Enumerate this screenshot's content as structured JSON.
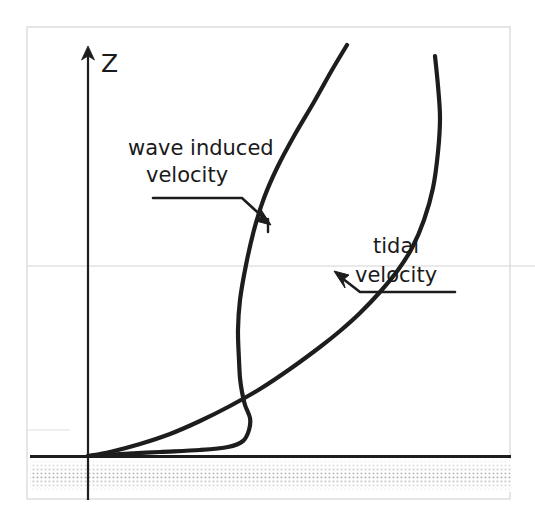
{
  "figure": {
    "type": "velocity-profile-diagram",
    "background_color": "#ffffff",
    "ink_color": "#1d1d1d",
    "frame_color": "#d8d8d8",
    "gridline_color": "#d0d0d0",
    "seabed_color": "#4a4a4a"
  },
  "axis": {
    "vertical_label": "Z",
    "arrow_direction": "up",
    "x_px": 88,
    "top_px": 48,
    "bottom_px": 500
  },
  "annotations": [
    {
      "id": "wave-induced-velocity",
      "line1": "wave induced",
      "line2": "velocity",
      "full_text": "wave induced velocity",
      "leader_style": "underline-then-elbow-arrow",
      "arrow_points_to": "wave induced velocity curve"
    },
    {
      "id": "tidal-velocity",
      "line1": "tidal",
      "line2": "velocity",
      "full_text": "tidal velocity",
      "leader_style": "underline-then-elbow-arrow",
      "arrow_points_to": "tidal velocity curve"
    }
  ],
  "seabed": {
    "name": "seabed",
    "pattern": "stippled-dots",
    "top_y_px": 456
  },
  "chart_data": {
    "type": "line",
    "title": "",
    "xlabel": "",
    "ylabel": "Z",
    "grid": false,
    "legend": "inline-annotations",
    "series": [
      {
        "name": "wave induced velocity",
        "description": "Thin wave boundary layer: steep near-bed rise with a velocity overshoot bulge just above the bed, then a nearly straight steep rise.",
        "points": [
          [
            88,
            456
          ],
          [
            120,
            454
          ],
          [
            160,
            452
          ],
          [
            200,
            450
          ],
          [
            228,
            447
          ],
          [
            243,
            441
          ],
          [
            249,
            430
          ],
          [
            250,
            418
          ],
          [
            245,
            405
          ],
          [
            242,
            392
          ],
          [
            240,
            378
          ],
          [
            239,
            360
          ],
          [
            238,
            330
          ],
          [
            240,
            300
          ],
          [
            246,
            265
          ],
          [
            254,
            230
          ],
          [
            264,
            198
          ],
          [
            277,
            168
          ],
          [
            294,
            136
          ],
          [
            314,
            102
          ],
          [
            332,
            70
          ],
          [
            347,
            45
          ]
        ]
      },
      {
        "name": "tidal velocity",
        "description": "Thick logarithmic-like tidal boundary layer profile: gradual curvature from the bed rising far to the right.",
        "points": [
          [
            88,
            456
          ],
          [
            110,
            452
          ],
          [
            140,
            444
          ],
          [
            170,
            434
          ],
          [
            200,
            421
          ],
          [
            230,
            406
          ],
          [
            260,
            389
          ],
          [
            290,
            369
          ],
          [
            320,
            347
          ],
          [
            340,
            331
          ],
          [
            360,
            313
          ],
          [
            380,
            292
          ],
          [
            398,
            270
          ],
          [
            412,
            248
          ],
          [
            424,
            220
          ],
          [
            433,
            188
          ],
          [
            438,
            152
          ],
          [
            440,
            118
          ],
          [
            438,
            86
          ],
          [
            435,
            56
          ]
        ]
      }
    ]
  }
}
